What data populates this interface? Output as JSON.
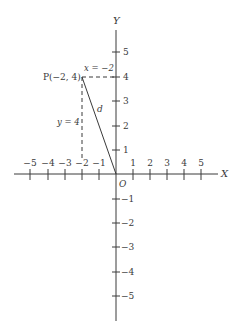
{
  "diagram": {
    "axes": {
      "x_label": "X",
      "y_label": "Y",
      "origin_label": "O",
      "x_ticks": [
        "−5",
        "−4",
        "−3",
        "−2",
        "−1",
        "1",
        "2",
        "3",
        "4",
        "5"
      ],
      "y_ticks_positive": [
        "1",
        "2",
        "3",
        "4",
        "5"
      ],
      "y_ticks_negative": [
        "−1",
        "−2",
        "−3",
        "−4",
        "−5"
      ]
    },
    "point": {
      "label": "P(−2, 4)",
      "x": -2,
      "y": 4
    },
    "annotations": {
      "horizontal_dashed": "x = −2",
      "vertical_dashed": "y = 4",
      "distance": "d"
    },
    "colors": {
      "line": "#3a3a3a",
      "background": "#ffffff"
    }
  }
}
